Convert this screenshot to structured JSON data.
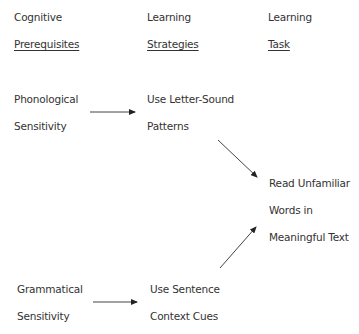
{
  "headers": {
    "col1": {
      "line1": "Cognitive",
      "line2": "Prerequisites"
    },
    "col2": {
      "line1": "Learning",
      "line2": "Strategies"
    },
    "col3": {
      "line1": "Learning",
      "line2": "Task"
    }
  },
  "nodes": {
    "phonological": {
      "line1": "Phonological",
      "line2": "Sensitivity"
    },
    "letter_sound": {
      "line1": "Use Letter-Sound",
      "line2": "Patterns"
    },
    "task": {
      "line1": "Read Unfamiliar",
      "line2": "Words in",
      "line3": "Meaningful Text"
    },
    "grammatical": {
      "line1": "Grammatical",
      "line2": "Sensitivity"
    },
    "sentence": {
      "line1": "Use Sentence",
      "line2": "Context Cues"
    }
  },
  "edges": [
    {
      "from": "phonological",
      "to": "letter_sound"
    },
    {
      "from": "letter_sound",
      "to": "task"
    },
    {
      "from": "sentence",
      "to": "task"
    },
    {
      "from": "grammatical",
      "to": "sentence"
    }
  ]
}
